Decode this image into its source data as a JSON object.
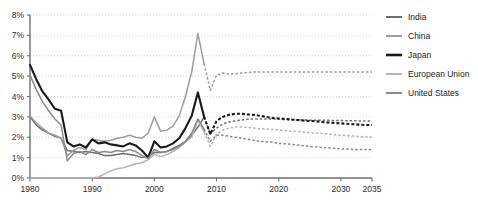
{
  "chart_data": {
    "type": "line",
    "title": "",
    "subtitle": "",
    "xlabel": "",
    "ylabel": "",
    "xlim": [
      1980,
      2035
    ],
    "ylim": [
      0,
      8
    ],
    "grid": "horizontal-dotted",
    "legend_position": "right",
    "x_ticks": [
      1980,
      1990,
      2000,
      2010,
      2020,
      2030,
      2035
    ],
    "x_tick_labels": [
      "1980",
      "1990",
      "2000",
      "2010",
      "2020",
      "2030",
      "2035"
    ],
    "y_ticks": [
      0,
      1,
      2,
      3,
      4,
      5,
      6,
      7,
      8
    ],
    "y_tick_labels": [
      "0%",
      "1%",
      "2%",
      "3%",
      "4%",
      "5%",
      "6%",
      "7%",
      "8%"
    ],
    "forecast_start_year": 2008,
    "forecast_note": "solid = historical, dashed = projection",
    "series": [
      {
        "name": "India",
        "color": "#6e6e6e",
        "width": 1.5,
        "x": [
          1980,
          1981,
          1982,
          1983,
          1984,
          1985,
          1986,
          1987,
          1988,
          1989,
          1990,
          1991,
          1992,
          1993,
          1994,
          1995,
          1996,
          1997,
          1998,
          1999,
          2000,
          2001,
          2002,
          2003,
          2004,
          2005,
          2006,
          2007,
          2008,
          2009,
          2010,
          2011,
          2012,
          2013,
          2014,
          2015,
          2016,
          2017,
          2018,
          2019,
          2020,
          2021,
          2022,
          2023,
          2024,
          2025,
          2026,
          2027,
          2028,
          2029,
          2030,
          2031,
          2032,
          2033,
          2034,
          2035
        ],
        "values": [
          3.0,
          2.6,
          2.35,
          2.2,
          2.05,
          1.95,
          1.35,
          1.3,
          1.25,
          1.3,
          1.25,
          1.2,
          1.1,
          1.1,
          1.15,
          1.2,
          1.15,
          1.1,
          1.0,
          1.05,
          1.25,
          1.25,
          1.3,
          1.45,
          1.6,
          1.8,
          2.1,
          2.5,
          3.0,
          2.15,
          2.45,
          2.65,
          2.75,
          2.8,
          2.85,
          2.88,
          2.9,
          2.9,
          2.9,
          2.9,
          2.88,
          2.87,
          2.86,
          2.85,
          2.85,
          2.84,
          2.84,
          2.83,
          2.83,
          2.82,
          2.82,
          2.81,
          2.81,
          2.8,
          2.8,
          2.8
        ]
      },
      {
        "name": "China",
        "color": "#9e9e9e",
        "width": 1.5,
        "x": [
          1980,
          1981,
          1982,
          1983,
          1984,
          1985,
          1986,
          1987,
          1988,
          1989,
          1990,
          1991,
          1992,
          1993,
          1994,
          1995,
          1996,
          1997,
          1998,
          1999,
          2000,
          2001,
          2002,
          2003,
          2004,
          2005,
          2006,
          2007,
          2008,
          2009,
          2010,
          2011,
          2012,
          2013,
          2014,
          2015,
          2016,
          2017,
          2018,
          2019,
          2020,
          2021,
          2022,
          2023,
          2024,
          2025,
          2026,
          2027,
          2028,
          2029,
          2030,
          2031,
          2032,
          2033,
          2034,
          2035
        ],
        "values": [
          3.05,
          2.7,
          2.45,
          2.2,
          2.1,
          1.95,
          1.1,
          1.35,
          1.5,
          1.4,
          1.9,
          1.85,
          1.8,
          1.85,
          1.95,
          2.0,
          2.1,
          2.0,
          1.95,
          2.2,
          3.0,
          2.3,
          2.35,
          2.55,
          3.05,
          4.0,
          5.2,
          7.1,
          5.6,
          4.3,
          5.05,
          5.15,
          5.1,
          5.12,
          5.15,
          5.18,
          5.2,
          5.2,
          5.2,
          5.2,
          5.2,
          5.2,
          5.2,
          5.2,
          5.2,
          5.2,
          5.2,
          5.2,
          5.2,
          5.2,
          5.2,
          5.2,
          5.2,
          5.2,
          5.2,
          5.2
        ]
      },
      {
        "name": "Japan",
        "color": "#1a1a1a",
        "width": 2.1,
        "x": [
          1980,
          1981,
          1982,
          1983,
          1984,
          1985,
          1986,
          1987,
          1988,
          1989,
          1990,
          1991,
          1992,
          1993,
          1994,
          1995,
          1996,
          1997,
          1998,
          1999,
          2000,
          2001,
          2002,
          2003,
          2004,
          2005,
          2006,
          2007,
          2008,
          2009,
          2010,
          2011,
          2012,
          2013,
          2014,
          2015,
          2016,
          2017,
          2018,
          2019,
          2020,
          2021,
          2022,
          2023,
          2024,
          2025,
          2026,
          2027,
          2028,
          2029,
          2030,
          2031,
          2032,
          2033,
          2034,
          2035
        ],
        "values": [
          5.55,
          4.85,
          4.25,
          3.85,
          3.4,
          3.3,
          1.75,
          1.55,
          1.65,
          1.5,
          1.9,
          1.7,
          1.75,
          1.65,
          1.6,
          1.55,
          1.7,
          1.6,
          1.35,
          1.0,
          1.8,
          1.5,
          1.55,
          1.7,
          1.95,
          2.45,
          3.05,
          4.2,
          3.0,
          2.15,
          2.8,
          3.0,
          3.1,
          3.15,
          3.15,
          3.12,
          3.1,
          3.05,
          3.0,
          2.95,
          2.92,
          2.9,
          2.87,
          2.85,
          2.82,
          2.8,
          2.78,
          2.75,
          2.72,
          2.7,
          2.68,
          2.66,
          2.64,
          2.62,
          2.6,
          2.6
        ]
      },
      {
        "name": "European Union",
        "color": "#b5b5b5",
        "width": 1.5,
        "x": [
          1980,
          1981,
          1982,
          1983,
          1984,
          1985,
          1986,
          1987,
          1988,
          1989,
          1990,
          1991,
          1992,
          1993,
          1994,
          1995,
          1996,
          1997,
          1998,
          1999,
          2000,
          2001,
          2002,
          2003,
          2004,
          2005,
          2006,
          2007,
          2008,
          2009,
          2010,
          2011,
          2012,
          2013,
          2014,
          2015,
          2016,
          2017,
          2018,
          2019,
          2020,
          2021,
          2022,
          2023,
          2024,
          2025,
          2026,
          2027,
          2028,
          2029,
          2030,
          2031,
          2032,
          2033,
          2034,
          2035
        ],
        "values": [
          0.0,
          0.0,
          0.0,
          0.0,
          0.0,
          0.0,
          0.0,
          0.0,
          0.0,
          0.0,
          0.0,
          0.05,
          0.2,
          0.35,
          0.45,
          0.5,
          0.6,
          0.7,
          0.75,
          0.9,
          1.15,
          1.05,
          1.15,
          1.3,
          1.5,
          1.75,
          2.0,
          2.85,
          2.25,
          1.55,
          2.15,
          2.35,
          2.45,
          2.5,
          2.5,
          2.48,
          2.45,
          2.42,
          2.4,
          2.38,
          2.35,
          2.33,
          2.3,
          2.28,
          2.25,
          2.22,
          2.2,
          2.18,
          2.15,
          2.12,
          2.1,
          2.08,
          2.06,
          2.04,
          2.02,
          2.0
        ]
      },
      {
        "name": "United States",
        "color": "#8a8a8a",
        "width": 1.5,
        "x": [
          1980,
          1981,
          1982,
          1983,
          1984,
          1985,
          1986,
          1987,
          1988,
          1989,
          1990,
          1991,
          1992,
          1993,
          1994,
          1995,
          1996,
          1997,
          1998,
          1999,
          2000,
          2001,
          2002,
          2003,
          2004,
          2005,
          2006,
          2007,
          2008,
          2009,
          2010,
          2011,
          2012,
          2013,
          2014,
          2015,
          2016,
          2017,
          2018,
          2019,
          2020,
          2021,
          2022,
          2023,
          2024,
          2025,
          2026,
          2027,
          2028,
          2029,
          2030,
          2031,
          2032,
          2033,
          2034,
          2035
        ],
        "values": [
          5.05,
          4.35,
          3.75,
          3.3,
          2.9,
          2.6,
          0.85,
          1.2,
          1.3,
          1.15,
          1.4,
          1.25,
          1.3,
          1.25,
          1.35,
          1.3,
          1.4,
          1.3,
          1.1,
          0.95,
          1.4,
          1.25,
          1.3,
          1.4,
          1.55,
          1.8,
          2.2,
          2.9,
          2.4,
          1.8,
          2.1,
          2.1,
          2.05,
          2.0,
          1.95,
          1.9,
          1.85,
          1.8,
          1.78,
          1.75,
          1.7,
          1.68,
          1.65,
          1.62,
          1.58,
          1.55,
          1.52,
          1.5,
          1.48,
          1.45,
          1.43,
          1.42,
          1.4,
          1.4,
          1.4,
          1.4
        ]
      }
    ]
  },
  "legend": {
    "items": [
      {
        "label": "India"
      },
      {
        "label": "China"
      },
      {
        "label": "Japan"
      },
      {
        "label": "European Union"
      },
      {
        "label": "United States"
      }
    ]
  },
  "colors": {
    "axis": "#6f6f6f",
    "grid": "#c9c9c9",
    "text": "#1d1d1d",
    "background": "#ffffff"
  }
}
